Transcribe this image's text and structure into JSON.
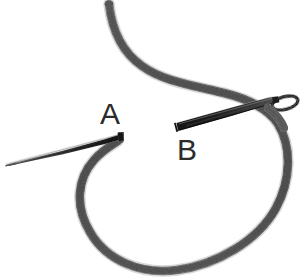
{
  "figure": {
    "background_color": "#ffffff",
    "width": 305,
    "height": 279
  },
  "colors": {
    "background": "#ffffff",
    "thread_gray": "#6f6f6f",
    "thread_gray_dark": "#4a4a4a",
    "thread_gray_light": "#9a9a9a",
    "needle_dark": "#1c1c1c",
    "needle_mid": "#3a3a3a",
    "needle_light": "#767676",
    "label_color": "#2b2b2b"
  },
  "labels": [
    {
      "id": "label-a",
      "text": "A",
      "x": 100,
      "y": 124,
      "refers_to": "left thin needle at thread hook"
    },
    {
      "id": "label-b",
      "text": "B",
      "x": 177,
      "y": 160,
      "refers_to": "right thick needle with eye"
    }
  ],
  "elements": {
    "thread": {
      "name": "suture-thread",
      "description": "Textured gray braided thread forming an S-curve descending from the top into a large open loop",
      "stroke_width": 8,
      "color": "#6f6f6f"
    },
    "needle_a": {
      "name": "needle-a",
      "description": "Thin tapered straight needle pointing left, tip at far left, attached at the thread hook",
      "tip_x": 5,
      "tip_y": 162,
      "base_x": 118,
      "base_y": 136,
      "color": "#1c1c1c"
    },
    "needle_b": {
      "name": "needle-b",
      "description": "Thick dark straight needle entering from left with an elongated oval eye at its right end through which the thread passes",
      "butt_x": 176,
      "butt_y": 128,
      "eye_x": 288,
      "eye_y": 104,
      "color": "#1c1c1c"
    },
    "needle_b_eye": {
      "name": "needle-eye",
      "description": "Elongated oval eye at the right end of needle B",
      "cx": 285,
      "cy": 103,
      "rx": 13,
      "ry": 6
    }
  }
}
